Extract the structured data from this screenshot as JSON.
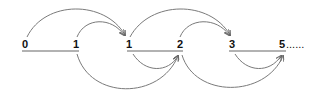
{
  "diagram": {
    "title": "",
    "colors": {
      "arc": "#7a7a7a",
      "line": "#666666",
      "text": "#111111",
      "background": "#ffffff"
    },
    "nodes": [
      {
        "id": "n0",
        "label": "0",
        "x": 25
      },
      {
        "id": "n1",
        "label": "1",
        "x": 76
      },
      {
        "id": "n2",
        "label": "1",
        "x": 129
      },
      {
        "id": "n3",
        "label": "2",
        "x": 180
      },
      {
        "id": "n4",
        "label": "3",
        "x": 232
      },
      {
        "id": "n5",
        "label": "5",
        "x": 282
      }
    ],
    "ellipsis": "......",
    "arcs": [
      {
        "from": "n0",
        "to": "n2",
        "side": "top"
      },
      {
        "from": "n1",
        "to": "n2",
        "side": "top"
      },
      {
        "from": "n2",
        "to": "n4",
        "side": "top"
      },
      {
        "from": "n3",
        "to": "n4",
        "side": "top"
      },
      {
        "from": "n1",
        "to": "n3",
        "side": "bottom"
      },
      {
        "from": "n2",
        "to": "n3",
        "side": "bottom"
      },
      {
        "from": "n3",
        "to": "n5",
        "side": "bottom"
      },
      {
        "from": "n4",
        "to": "n5",
        "side": "bottom"
      }
    ]
  }
}
